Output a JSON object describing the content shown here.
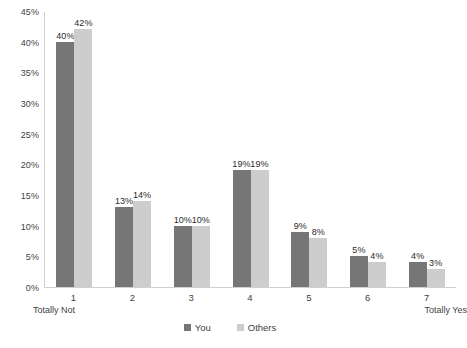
{
  "chart_data": {
    "type": "bar",
    "title": "",
    "subtitle": "",
    "xlabel": "",
    "ylabel": "",
    "categories": [
      "1",
      "2",
      "3",
      "4",
      "5",
      "6",
      "7"
    ],
    "x_axis_endpoint_labels": {
      "left": "Totally Not",
      "right": "Totally Yes"
    },
    "series": [
      {
        "name": "You",
        "color": "#767676",
        "values": [
          40,
          13,
          10,
          19,
          9,
          5,
          4
        ],
        "labels": [
          "40%",
          "13%",
          "10%",
          "19%",
          "9%",
          "5%",
          "4%"
        ]
      },
      {
        "name": "Others",
        "color": "#cdcdcd",
        "values": [
          42,
          14,
          10,
          19,
          8,
          4,
          3
        ],
        "labels": [
          "42%",
          "14%",
          "10%",
          "19%",
          "8%",
          "4%",
          "3%"
        ]
      }
    ],
    "ylim": [
      0,
      45
    ],
    "y_ticks": [
      0,
      5,
      10,
      15,
      20,
      25,
      30,
      35,
      40,
      45
    ],
    "y_tick_labels": [
      "0%",
      "5%",
      "10%",
      "15%",
      "20%",
      "25%",
      "30%",
      "35%",
      "40%",
      "45%"
    ],
    "grid": false,
    "legend_position": "bottom",
    "data_labels": true
  },
  "legend": {
    "items": [
      {
        "label": "You",
        "swatch": "legend-swatch-you"
      },
      {
        "label": "Others",
        "swatch": "legend-swatch-others"
      }
    ]
  },
  "axes": {
    "y_label_0": "0%",
    "y_label_1": "5%",
    "y_label_2": "10%",
    "y_label_3": "15%",
    "y_label_4": "20%",
    "y_label_5": "25%",
    "y_label_6": "30%",
    "y_label_7": "35%",
    "y_label_8": "40%",
    "y_label_9": "45%"
  }
}
